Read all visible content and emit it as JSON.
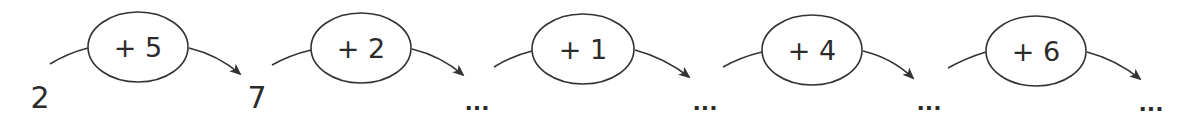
{
  "diagram": {
    "start_value": "2",
    "steps": [
      {
        "operator": "+ 5",
        "result": "7"
      },
      {
        "operator": "+ 2",
        "result": "..."
      },
      {
        "operator": "+ 1",
        "result": "..."
      },
      {
        "operator": "+ 4",
        "result": "..."
      },
      {
        "operator": "+ 6",
        "result": "..."
      }
    ],
    "stroke_color": "#333333"
  }
}
